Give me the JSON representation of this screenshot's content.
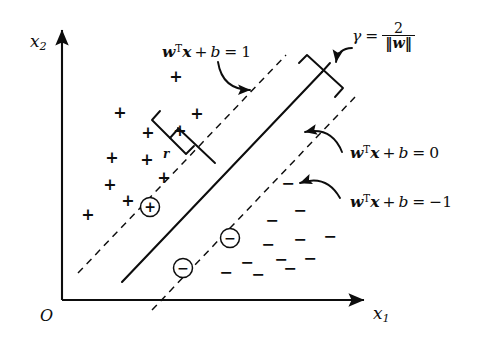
{
  "figure": {
    "background": "#ffffff",
    "ink": "#0d0d0d"
  },
  "axes": {
    "y_label": "x",
    "y_label_sub": "2",
    "x_label": "x",
    "x_label_sub": "1",
    "origin_label": "O",
    "y_axis": {
      "x": 62,
      "y_top": 27,
      "y_bottom": 300
    },
    "x_axis": {
      "y": 300,
      "x_left": 62,
      "x_right": 368
    }
  },
  "labels": {
    "margin_plus": {
      "w": "w",
      "sup_T": "T",
      "x": "x",
      "plus": "+",
      "b": "b",
      "eq": "=",
      "value": "1",
      "pos": {
        "left": 162,
        "top": 44
      }
    },
    "boundary": {
      "w": "w",
      "sup_T": "T",
      "x": "x",
      "plus": "+",
      "b": "b",
      "eq": "=",
      "value": "0",
      "pos": {
        "left": 350,
        "top": 145
      }
    },
    "margin_minus": {
      "w": "w",
      "sup_T": "T",
      "x": "x",
      "plus": "+",
      "b": "b",
      "eq": "=",
      "value": "−1",
      "pos": {
        "left": 350,
        "top": 194
      }
    },
    "gamma": {
      "symbol": "γ",
      "eq": "=",
      "numerator": "2",
      "denominator": "‖w‖",
      "pos": {
        "left": 352,
        "top": 22
      }
    },
    "r": {
      "text": "r",
      "pos": {
        "left": 163,
        "top": 148
      }
    }
  },
  "geometry": {
    "boundary_line": {
      "x1": 122,
      "y1": 282,
      "x2": 322,
      "y2": 72,
      "style": "solid",
      "width": 2.0
    },
    "margin_line_plus": {
      "x1": 78,
      "y1": 273,
      "x2": 286,
      "y2": 55,
      "style": "dashed",
      "width": 1.4
    },
    "margin_line_minus": {
      "x1": 152,
      "y1": 310,
      "x2": 355,
      "y2": 97,
      "style": "dashed",
      "width": 1.4
    },
    "perpendicular_segment": {
      "x1": 178,
      "y1": 128,
      "x2": 215,
      "y2": 163
    },
    "margin_bracket": {
      "desc": "square bracket spanning margin width near r"
    },
    "gamma_bracket": {
      "desc": "square bracket across margin at upper right"
    }
  },
  "points": {
    "positive_symbol": "+",
    "negative_symbol": "−",
    "support_positive_symbol": "⊕",
    "support_negative_symbol": "⊖",
    "positives": [
      {
        "x": 120,
        "y": 112
      },
      {
        "x": 148,
        "y": 132
      },
      {
        "x": 112,
        "y": 157
      },
      {
        "x": 147,
        "y": 159
      },
      {
        "x": 110,
        "y": 184
      },
      {
        "x": 164,
        "y": 177
      },
      {
        "x": 128,
        "y": 200
      },
      {
        "x": 88,
        "y": 214
      },
      {
        "x": 176,
        "y": 76
      },
      {
        "x": 197,
        "y": 113
      },
      {
        "x": 180,
        "y": 130
      }
    ],
    "negatives": [
      {
        "x": 288,
        "y": 183
      },
      {
        "x": 300,
        "y": 210
      },
      {
        "x": 272,
        "y": 220
      },
      {
        "x": 268,
        "y": 244
      },
      {
        "x": 300,
        "y": 239
      },
      {
        "x": 330,
        "y": 236
      },
      {
        "x": 247,
        "y": 262
      },
      {
        "x": 281,
        "y": 259
      },
      {
        "x": 310,
        "y": 258
      },
      {
        "x": 226,
        "y": 272
      },
      {
        "x": 258,
        "y": 274
      },
      {
        "x": 290,
        "y": 268
      }
    ],
    "support_positives": [
      {
        "x": 150,
        "y": 207
      }
    ],
    "support_negatives": [
      {
        "x": 230,
        "y": 238
      },
      {
        "x": 183,
        "y": 268
      }
    ]
  },
  "arrows": [
    {
      "name": "arrow-to-margin-plus-line",
      "from": [
        218,
        62
      ],
      "to": [
        250,
        90
      ]
    },
    {
      "name": "arrow-to-boundary-line",
      "from": [
        342,
        152
      ],
      "to": [
        305,
        132
      ]
    },
    {
      "name": "arrow-to-margin-minus-line",
      "from": [
        340,
        198
      ],
      "to": [
        300,
        183
      ]
    },
    {
      "name": "arrow-gamma-tick",
      "from": [
        352,
        48
      ],
      "to": [
        336,
        62
      ]
    }
  ]
}
